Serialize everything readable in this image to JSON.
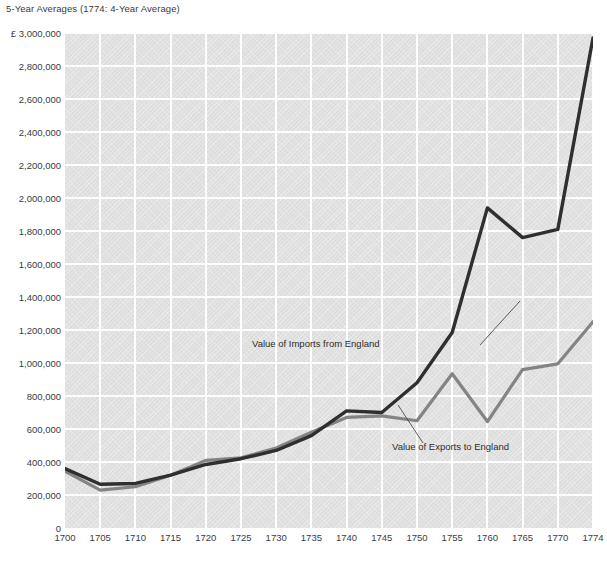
{
  "chart_data": {
    "type": "line",
    "title": "5-Year Averages (1774: 4-Year Average)",
    "xlabel": "",
    "ylabel": "",
    "currency_symbol": "£",
    "grid": true,
    "legend": "annotations-inline",
    "x": [
      1700,
      1705,
      1710,
      1715,
      1720,
      1725,
      1730,
      1735,
      1740,
      1745,
      1750,
      1755,
      1760,
      1765,
      1770,
      1774
    ],
    "xlim": [
      1700,
      1774
    ],
    "ylim": [
      0,
      3000000
    ],
    "ytick_labels": [
      "£ 3,000,000",
      "2,800,000",
      "2,600,000",
      "2,400,000",
      "2,200,000",
      "2,000,000",
      "1,800,000",
      "1,600,000",
      "1,400,000",
      "1,200,000",
      "1,000,000",
      "800,000",
      "600,000",
      "400,000",
      "200,000",
      "0"
    ],
    "ytick_values": [
      3000000,
      2800000,
      2600000,
      2400000,
      2200000,
      2000000,
      1800000,
      1600000,
      1400000,
      1200000,
      1000000,
      800000,
      600000,
      400000,
      200000,
      0
    ],
    "xtick_labels": [
      "1700",
      "1705",
      "1710",
      "1715",
      "1720",
      "1725",
      "1730",
      "1735",
      "1740",
      "1745",
      "1750",
      "1755",
      "1760",
      "1765",
      "1770",
      "1774"
    ],
    "series": [
      {
        "name": "Value of Imports from England",
        "color": "#2f2f2f",
        "values": [
          360000,
          265000,
          270000,
          320000,
          385000,
          420000,
          470000,
          560000,
          710000,
          700000,
          880000,
          1185000,
          1940000,
          1760000,
          1810000,
          2970000
        ]
      },
      {
        "name": "Value of Exports to England",
        "color": "#848484",
        "values": [
          345000,
          230000,
          250000,
          320000,
          410000,
          425000,
          485000,
          580000,
          670000,
          680000,
          650000,
          935000,
          645000,
          960000,
          995000,
          1250000
        ]
      }
    ],
    "annotations": [
      {
        "text": "Value of Imports from England",
        "series": "Value of Imports from England"
      },
      {
        "text": "Value of Exports to England",
        "series": "Value of Exports to England"
      }
    ]
  },
  "colors": {
    "plot_background": "#e3e3e3",
    "gridline": "#fdfdfd",
    "page_background": "#ffffff",
    "text": "#3c3c3c",
    "imports_line": "#2f2f2f",
    "exports_line": "#848484"
  }
}
